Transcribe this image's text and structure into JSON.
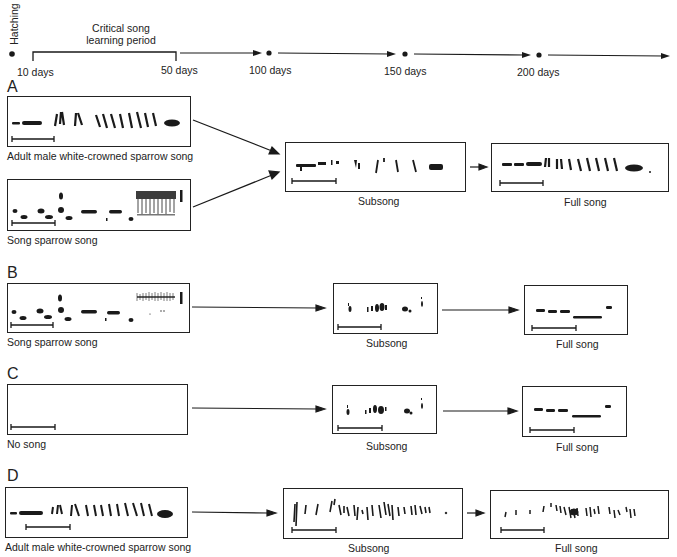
{
  "timeline": {
    "hatching_label": "Hatching",
    "critical_period_label_line1": "Critical song",
    "critical_period_label_line2": "learning period",
    "ticks": [
      "10 days",
      "50 days",
      "100 days",
      "150 days",
      "200 days"
    ]
  },
  "panels": [
    {
      "letter": "A",
      "inputs": [
        {
          "caption": "Adult male white-crowned sparrow song",
          "pattern": "wcs"
        },
        {
          "caption": "Song sparrow song",
          "pattern": "ss"
        }
      ],
      "subsong_caption": "Subsong",
      "fullsong_caption": "Full song"
    },
    {
      "letter": "B",
      "inputs": [
        {
          "caption": "Song sparrow song",
          "pattern": "ss_faint"
        }
      ],
      "subsong_caption": "Subsong",
      "fullsong_caption": "Full song"
    },
    {
      "letter": "C",
      "inputs": [
        {
          "caption": "No song",
          "pattern": "none"
        }
      ],
      "subsong_caption": "Subsong",
      "fullsong_caption": "Full song"
    },
    {
      "letter": "D",
      "inputs": [
        {
          "caption": "Adult male white-crowned sparrow song",
          "pattern": "wcs"
        }
      ],
      "subsong_caption": "Subsong",
      "fullsong_caption": "Full song"
    }
  ],
  "colors": {
    "ink": "#1a1a1a",
    "background": "#ffffff"
  }
}
